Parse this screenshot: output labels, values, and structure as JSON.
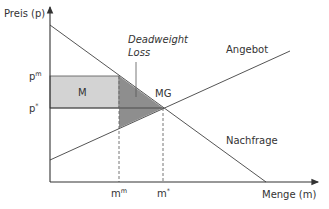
{
  "diagram": {
    "y_axis_label": "Preis (p)",
    "x_axis_label": "Menge (m)",
    "supply_label": "Angebot",
    "demand_label": "Nachfrage",
    "deadweight_label_line1": "Deadweight",
    "deadweight_label_line2": "Loss",
    "area_m_label": "M",
    "area_mg_label": "MG",
    "price_monopoly": {
      "base": "p",
      "sup": "m"
    },
    "price_equilibrium": {
      "base": "p",
      "sup": "*"
    },
    "quantity_monopoly": {
      "base": "m",
      "sup": "m"
    },
    "quantity_equilibrium": {
      "base": "m",
      "sup": "*"
    },
    "colors": {
      "axis": "#333333",
      "line": "#555555",
      "rect_fill": "#d3d3d3",
      "triangle_fill": "#8e8e8e",
      "dashed": "#666666"
    }
  }
}
